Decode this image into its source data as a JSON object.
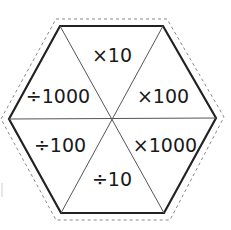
{
  "diagram": {
    "shape": "hexagon",
    "colors": {
      "outline": "#222222",
      "dividers": "#555555",
      "cut_line": "#888888",
      "text": "#1a1a1a",
      "background": "#ffffff"
    },
    "segments": [
      {
        "position": "top",
        "label": "×10"
      },
      {
        "position": "upper-left",
        "label": "÷1000"
      },
      {
        "position": "upper-right",
        "label": "×100"
      },
      {
        "position": "lower-left",
        "label": "÷100"
      },
      {
        "position": "lower-right",
        "label": "×1000"
      },
      {
        "position": "bottom",
        "label": "÷10"
      }
    ]
  }
}
